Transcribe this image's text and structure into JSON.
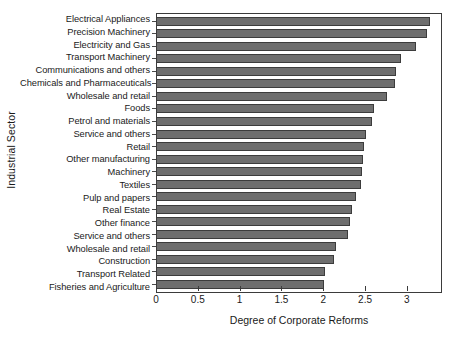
{
  "chart_data": {
    "type": "bar",
    "orientation": "horizontal",
    "title": "",
    "xlabel": "Degree of Corporate Reforms",
    "ylabel": "Industrial Sector",
    "xlim": [
      0,
      3.42
    ],
    "xticks": [
      0,
      0.5,
      1,
      1.5,
      2,
      2.5,
      3
    ],
    "xticklabels": [
      "0",
      "0.5",
      "1",
      "1.5",
      "2",
      "2.5",
      "3"
    ],
    "grid": false,
    "legend": null,
    "bar_color": "#6e6e6e",
    "bar_edge_color": "#3c3c3c",
    "axis_color": "#3b3b3b",
    "categories": [
      "Electrical Appliances",
      "Precision Machinery",
      "Electricity and Gas",
      "Transport Machinery",
      "Communications and others",
      "Chemicals and Pharmaceuticals",
      "Wholesale and retail",
      "Foods",
      "Petrol and materials",
      "Service and others",
      "Retail",
      "Other manufacturing",
      "Machinery",
      "Textiles",
      "Pulp and papers",
      "Real Estate",
      "Other finance",
      "Service and others",
      "Wholesale and retail",
      "Construction",
      "Transport Related",
      "Fisheries and Agriculture"
    ],
    "values": [
      3.26,
      3.23,
      3.1,
      2.92,
      2.86,
      2.84,
      2.75,
      2.6,
      2.57,
      2.5,
      2.47,
      2.46,
      2.45,
      2.44,
      2.38,
      2.33,
      2.31,
      2.28,
      2.14,
      2.12,
      2.01,
      2.0
    ]
  }
}
